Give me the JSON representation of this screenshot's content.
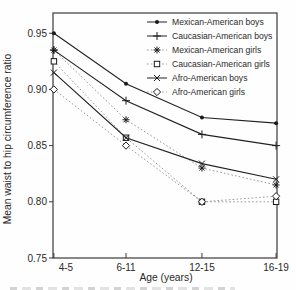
{
  "chart_data": {
    "type": "line",
    "title": "",
    "xlabel": "Age (years)",
    "ylabel": "Mean waist to hip circumference ratio",
    "categories": [
      "4-5",
      "6-11",
      "12-15",
      "16-19"
    ],
    "ytick_labels": [
      "0.95",
      "0.90",
      "0.85",
      "0.80",
      "0.75"
    ],
    "ytick_values": [
      0.95,
      0.9,
      0.85,
      0.8,
      0.75
    ],
    "ylim": [
      0.75,
      0.968
    ],
    "grid": false,
    "legend_position": "top-right-inside",
    "series": [
      {
        "name": "Mexican-American boys",
        "marker": "dot-filled",
        "line": "solid",
        "values": [
          0.95,
          0.905,
          0.875,
          0.87
        ]
      },
      {
        "name": "Caucasian-American boys",
        "marker": "plus",
        "line": "solid",
        "values": [
          0.935,
          0.89,
          0.86,
          0.85
        ]
      },
      {
        "name": "Mexican-American girls",
        "marker": "asterisk",
        "line": "dotted",
        "values": [
          0.935,
          0.873,
          0.83,
          0.815
        ]
      },
      {
        "name": "Caucasian-American girls",
        "marker": "square-open",
        "line": "dotted",
        "values": [
          0.925,
          0.857,
          0.8,
          0.8
        ]
      },
      {
        "name": "Afro-American boys",
        "marker": "x",
        "line": "solid",
        "values": [
          0.915,
          0.857,
          0.834,
          0.82
        ]
      },
      {
        "name": "Afro-American girls",
        "marker": "diamond-open",
        "line": "dotted",
        "values": [
          0.9,
          0.85,
          0.8,
          0.805
        ]
      }
    ],
    "colors": {
      "solid_line": "#222222",
      "dotted_line": "#9a9a9a",
      "marker": "#1a1a1a",
      "axis": "#3a3a3a",
      "text": "#2a2a2a",
      "background": "#fefefe"
    }
  }
}
